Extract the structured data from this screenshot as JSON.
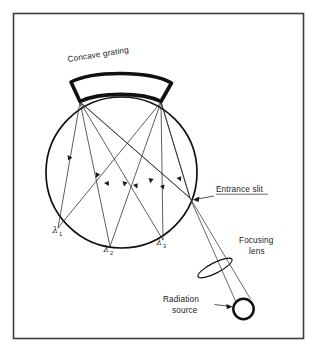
{
  "figure": {
    "kind": "optical-schematic",
    "frame": {
      "border_color": "#3a3a3a"
    },
    "background_color": "#ffffff",
    "ink_color": "#111111"
  },
  "labels": {
    "grating": "Concave grating",
    "entrance_slit": "Entrance slit",
    "focusing_lens_line1": "Focusing",
    "focusing_lens_line2": "lens",
    "radiation_source_line1": "Radiation",
    "radiation_source_line2": "source",
    "lambda_symbol": "λ",
    "lambda1_sub": "1",
    "lambda2_sub": "2",
    "lambda3_sub": "3"
  },
  "components": [
    {
      "name": "concave-grating",
      "label": "Concave grating",
      "shape": "thick curved band (arc segment)",
      "stroke_width": 3.4
    },
    {
      "name": "rowland-circle",
      "label": "",
      "shape": "circle",
      "center": [
        121.5,
        172.5
      ],
      "radius": 75.5,
      "stroke_width": 1.5
    },
    {
      "name": "entrance-slit",
      "label": "Entrance slit",
      "point": [
        190.0,
        198.0
      ]
    },
    {
      "name": "focusing-lens",
      "label": "Focusing lens",
      "shape": "tilted ellipse",
      "center": [
        215.0,
        268.0
      ],
      "rx": 18.5,
      "ry": 5.2,
      "rotation_deg": -28
    },
    {
      "name": "radiation-source",
      "label": "Radiation source",
      "shape": "thick circle",
      "center": [
        243.0,
        309.0
      ],
      "radius": 10.0,
      "stroke_width": 2.4
    }
  ],
  "grating_endpoints": {
    "left": [
      80.0,
      101.5
    ],
    "right": [
      161.0,
      101.5
    ]
  },
  "spectral_orders": [
    {
      "symbol": "λ",
      "subscript": "1",
      "focus_point": [
        58.0,
        228.0
      ],
      "label_at": [
        54.0,
        231.0
      ]
    },
    {
      "symbol": "λ",
      "subscript": "2",
      "focus_point": [
        110.0,
        246.5
      ],
      "label_at": [
        104.0,
        249.5
      ]
    },
    {
      "symbol": "λ",
      "subscript": "3",
      "focus_point": [
        163.0,
        240.0
      ],
      "label_at": [
        158.0,
        243.0
      ]
    }
  ],
  "beam_path": {
    "from": "radiation-source",
    "through": "focusing-lens",
    "to": "entrance-slit"
  }
}
